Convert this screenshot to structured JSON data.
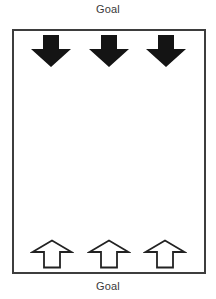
{
  "diagram": {
    "top_label": "Goal",
    "bottom_label": "Goal",
    "field": {
      "shape": "rectangle",
      "border_color": "#3d3d3d",
      "background": "#ffffff"
    },
    "top_arrows": {
      "count": 3,
      "direction": "down",
      "style": "filled",
      "fill_color": "#141414"
    },
    "bottom_arrows": {
      "count": 3,
      "direction": "up",
      "style": "outlined",
      "fill_color": "#ffffff",
      "outline_color": "#222222"
    }
  }
}
